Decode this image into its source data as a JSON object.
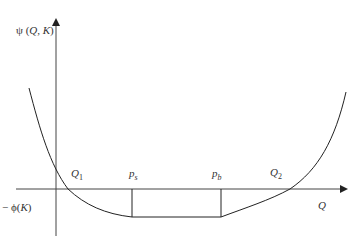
{
  "diagram": {
    "y_axis_label": {
      "prefix": "ψ (",
      "var1": "Q",
      "sep": ", ",
      "var2": "K",
      "suffix": ")"
    },
    "x_axis_label": "Q",
    "neg_phi_label": {
      "prefix": "− ϕ(",
      "var": "K",
      "suffix": ")"
    },
    "points": {
      "Q1": {
        "main": "Q",
        "sub": "1"
      },
      "ps": {
        "main": "p",
        "sub": "s"
      },
      "pb": {
        "main": "p",
        "sub": "b"
      },
      "Q2": {
        "main": "Q",
        "sub": "2"
      }
    }
  }
}
